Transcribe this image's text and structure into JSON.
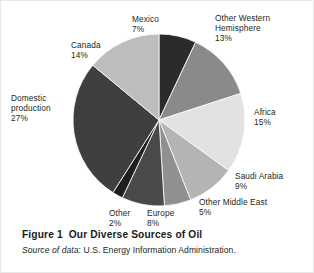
{
  "figure": {
    "caption_prefix": "Figure 1",
    "caption_title": "Our Diverse Sources of Oil",
    "caption_full": "Figure 1  Our Diverse Sources of Oil",
    "source_lead": "Source of data",
    "source_rest": ": U.S. Energy Information Administration.",
    "source_full": "Source of data: U.S. Energy Information Administration."
  },
  "labels": {
    "mexico": "Mexico\n7%",
    "other_western_hemisphere": "Other Western\nHemisphere\n13%",
    "africa": "Africa\n15%",
    "saudi_arabia": "Saudi Arabia\n9%",
    "other_middle_east": "Other Middle East\n5%",
    "europe": "Europe\n8%",
    "other": "Other\n2%",
    "domestic_production": "Domestic\nproduction\n27%",
    "canada": "Canada\n14%"
  },
  "chart_data": {
    "type": "pie",
    "title": "Our Diverse Sources of Oil",
    "subtitle": "",
    "xlabel": "",
    "ylabel": "",
    "legend_position": "none",
    "labels_position": "outside",
    "grid": false,
    "units": "percent",
    "total": 100,
    "start_angle_deg": 0,
    "direction": "clockwise",
    "categories": [
      "Mexico",
      "Other Western Hemisphere",
      "Africa",
      "Saudi Arabia",
      "Other Middle East",
      "Europe",
      "Other",
      "Domestic production",
      "Canada"
    ],
    "values": [
      7,
      13,
      15,
      9,
      5,
      8,
      2,
      27,
      14
    ],
    "slices": [
      {
        "name": "Mexico",
        "value": 7,
        "label": "Mexico 7%",
        "color": "#2b2b2b"
      },
      {
        "name": "Other Western Hemisphere",
        "value": 13,
        "label": "Other Western Hemisphere 13%",
        "color": "#8a8a8a"
      },
      {
        "name": "Africa",
        "value": 15,
        "label": "Africa 15%",
        "color": "#e2e2e2"
      },
      {
        "name": "Saudi Arabia",
        "value": 9,
        "label": "Saudi Arabia 9%",
        "color": "#b4b4b4"
      },
      {
        "name": "Other Middle East",
        "value": 5,
        "label": "Other Middle East 5%",
        "color": "#909090"
      },
      {
        "name": "Europe",
        "value": 8,
        "label": "Europe 8%",
        "color": "#4a4a4a"
      },
      {
        "name": "Other",
        "value": 2,
        "label": "Other 2%",
        "color": "#1f1f1f"
      },
      {
        "name": "Domestic production",
        "value": 27,
        "label": "Domestic production 27%",
        "color": "#3f3f3f"
      },
      {
        "name": "Canada",
        "value": 14,
        "label": "Canada 14%",
        "color": "#bdbdbd"
      }
    ]
  },
  "colors": {
    "page_background": "#ffffff",
    "border": "#e8e8e8",
    "text": "#231f20",
    "caption_text": "#1a1a1a"
  }
}
